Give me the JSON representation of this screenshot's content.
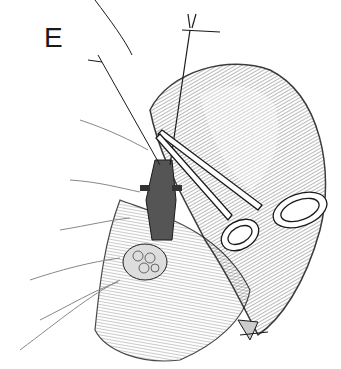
{
  "figure": {
    "panel_label": "E",
    "elements": [
      {
        "name": "panel-label",
        "text": "E"
      },
      {
        "name": "retraction-suture-left"
      },
      {
        "name": "retraction-suture-right"
      },
      {
        "name": "hemostat-clamp"
      },
      {
        "name": "saccular-organ"
      },
      {
        "name": "ligated-vessel"
      },
      {
        "name": "fatty-tissue"
      },
      {
        "name": "mesentery-vessels"
      },
      {
        "name": "ligated-apex"
      }
    ],
    "colors": {
      "ink": "#1a1a1a",
      "paper": "#ffffff",
      "shade": "#9a9a9a"
    }
  }
}
